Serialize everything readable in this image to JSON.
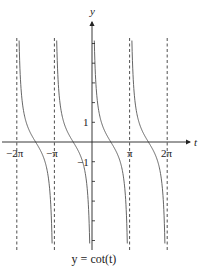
{
  "chart_data": {
    "type": "line",
    "title": "y = cot(t)",
    "function": "cot",
    "xlabel": "t",
    "ylabel": "y",
    "x_tick_labels": [
      "-2π",
      "-π",
      "π",
      "2π"
    ],
    "x_ticks": [
      -6.2832,
      -3.1416,
      3.1416,
      6.2832
    ],
    "y_tick_labels": [
      "1",
      "-1"
    ],
    "y_ticks": [
      -5,
      -4,
      -3,
      -2,
      -1,
      1,
      2,
      3,
      4,
      5
    ],
    "xlim": [
      -6.8,
      7.4
    ],
    "ylim": [
      -5.2,
      5.2
    ],
    "asymptotes": [
      -6.2832,
      -3.1416,
      0,
      3.1416,
      6.2832
    ],
    "asymptote_style": "dashed",
    "branches": [
      {
        "from": -6.2832,
        "to": -3.1416
      },
      {
        "from": -3.1416,
        "to": 0
      },
      {
        "from": 0,
        "to": 3.1416
      },
      {
        "from": 3.1416,
        "to": 6.2832
      }
    ],
    "grid": false,
    "legend": "none"
  },
  "axes": {
    "x_label": "t",
    "y_label": "y"
  },
  "ticks": {
    "neg_two_pi": "−2π",
    "neg_pi": "−π",
    "pi": "π",
    "two_pi": "2π",
    "one": "1",
    "neg_one": "−1"
  },
  "caption": "y = cot(t)"
}
